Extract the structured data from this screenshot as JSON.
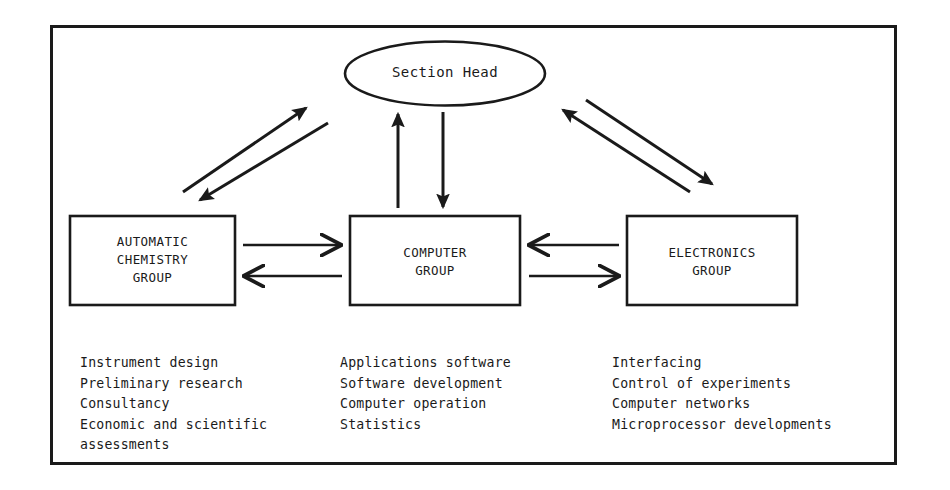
{
  "diagram": {
    "frame": {
      "border_color": "#1a1a1a"
    },
    "stroke_color": "#1a1a1a",
    "head": {
      "label": "Section Head",
      "shape": "ellipse"
    },
    "groups": [
      {
        "id": "automatic-chemistry-group",
        "label": "AUTOMATIC\nCHEMISTRY\nGROUP",
        "activities": [
          "Instrument design",
          "Preliminary research",
          "Consultancy",
          "Economic and scientific",
          "assessments"
        ]
      },
      {
        "id": "computer-group",
        "label": "COMPUTER\nGROUP",
        "activities": [
          "Applications software",
          "Software development",
          "Computer operation",
          "Statistics"
        ]
      },
      {
        "id": "electronics-group",
        "label": "ELECTRONICS\nGROUP",
        "activities": [
          "Interfacing",
          "Control of experiments",
          "Computer networks",
          "Microprocessor developments"
        ]
      }
    ],
    "connectors": [
      {
        "id": "automatic-to-head",
        "from": "automatic-chemistry-group",
        "to": "section-head",
        "style": "solid-filled-arrow"
      },
      {
        "id": "head-to-automatic",
        "from": "section-head",
        "to": "automatic-chemistry-group",
        "style": "solid-filled-arrow"
      },
      {
        "id": "computer-to-head",
        "from": "computer-group",
        "to": "section-head",
        "style": "solid-filled-arrow"
      },
      {
        "id": "head-to-computer",
        "from": "section-head",
        "to": "computer-group",
        "style": "solid-filled-arrow"
      },
      {
        "id": "electronics-to-head",
        "from": "electronics-group",
        "to": "section-head",
        "style": "solid-filled-arrow"
      },
      {
        "id": "head-to-electronics",
        "from": "section-head",
        "to": "electronics-group",
        "style": "solid-filled-arrow"
      },
      {
        "id": "automatic-to-computer",
        "from": "automatic-chemistry-group",
        "to": "computer-group",
        "style": "open-arrow"
      },
      {
        "id": "computer-to-automatic",
        "from": "computer-group",
        "to": "automatic-chemistry-group",
        "style": "open-arrow"
      },
      {
        "id": "electronics-to-computer",
        "from": "electronics-group",
        "to": "computer-group",
        "style": "open-arrow"
      },
      {
        "id": "computer-to-electronics",
        "from": "computer-group",
        "to": "electronics-group",
        "style": "open-arrow"
      }
    ]
  }
}
